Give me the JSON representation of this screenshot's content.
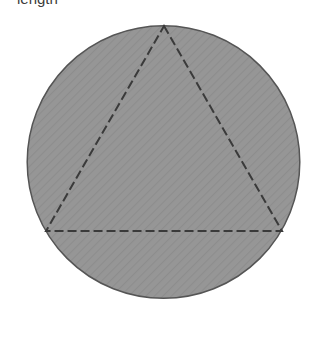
{
  "canvas": {
    "width": 330,
    "height": 347,
    "background_color": "#ffffff"
  },
  "caption": {
    "text": "length",
    "color": "#3b3b3b",
    "note": "clipped by top edge of screenshot"
  },
  "figure": {
    "name": "equilateral-triangle-inscribed-in-circle",
    "circle": {
      "center_x": 163.5,
      "center_y": 162,
      "radius": 137,
      "fill_color": "#969696",
      "stroke_color": "#555555",
      "stroke_width": 1.5,
      "hatch_color": "#8d8d8d"
    },
    "triangle": {
      "label": "inscribed equilateral triangle",
      "stroke_color": "#3a3a3a",
      "stroke_width": 2,
      "dash_length": 9,
      "gap_length": 4,
      "fill": "none",
      "vertices": [
        {
          "name": "apex",
          "x": 164,
          "y": 26
        },
        {
          "name": "bottom-right",
          "x": 282,
          "y": 231
        },
        {
          "name": "bottom-left",
          "x": 46,
          "y": 231
        }
      ]
    }
  }
}
